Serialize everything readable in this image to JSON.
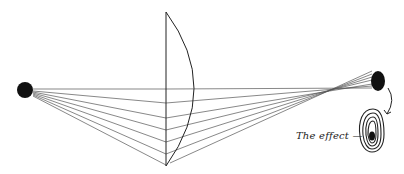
{
  "diagram": {
    "caption_label": "The effect —",
    "colors": {
      "ink": "#111111",
      "ray": "#555555",
      "background": "#ffffff"
    },
    "elements": {
      "source_point": "light source (black dot, left)",
      "lens": "plano-convex lens",
      "image_point": "focused image (black dot, right)",
      "effect": "concentric rings with dark center"
    }
  }
}
